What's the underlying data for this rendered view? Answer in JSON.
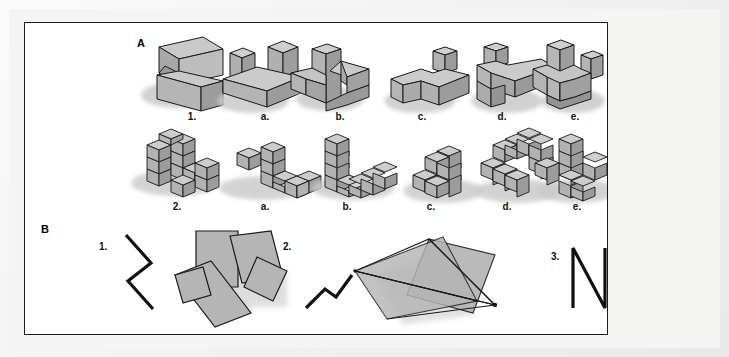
{
  "figure": {
    "background_color": "#ffffff",
    "frame_color": "#1b1b1b",
    "mat_color": "#f4f4f3",
    "shape_fill": "#b3b3b3",
    "shape_fill_light": "#c9c9c9",
    "shape_fill_dark": "#8e8e8e",
    "stroke_color": "#1a1a1a",
    "shadow_color": "#c4c4c4"
  },
  "sections": {
    "a": {
      "label": "A",
      "rows": [
        {
          "row_id": "row-blocks",
          "items": [
            {
              "label": "1.",
              "kind": "target",
              "shape": "s-block-prism"
            },
            {
              "label": "a.",
              "kind": "option",
              "shape": "two-posts-on-slab"
            },
            {
              "label": "b.",
              "kind": "option",
              "shape": "tall-post-with-steps"
            },
            {
              "label": "c.",
              "kind": "option",
              "shape": "L-slab-with-post"
            },
            {
              "label": "d.",
              "kind": "option",
              "shape": "flat-L-with-post"
            },
            {
              "label": "e.",
              "kind": "option",
              "shape": "u-channel-with-posts"
            }
          ]
        },
        {
          "row_id": "row-cubes",
          "items": [
            {
              "label": "2.",
              "kind": "target",
              "shape": "cube-wall-assembly"
            },
            {
              "label": "a.",
              "kind": "option",
              "shape": "cube-zigzag-arm"
            },
            {
              "label": "b.",
              "kind": "option",
              "shape": "cube-L-column"
            },
            {
              "label": "c.",
              "kind": "option",
              "shape": "cube-stair-branch"
            },
            {
              "label": "d.",
              "kind": "option",
              "shape": "cube-ring-hook"
            },
            {
              "label": "e.",
              "kind": "option",
              "shape": "cube-cross-tower"
            }
          ]
        }
      ]
    },
    "b": {
      "label": "B",
      "items": [
        {
          "number": "1.",
          "simple_figure": "zigzag-z-vertical",
          "complex_figure": "overlapping-rectangles-pinwheel"
        },
        {
          "number": "2.",
          "simple_figure": "zigzag-step-diagonal",
          "complex_figure": "overlapping-quadrilaterals-star"
        },
        {
          "number": "3.",
          "simple_figure": "letter-n",
          "complex_figure": "quadrilateral-with-spike"
        }
      ]
    }
  }
}
